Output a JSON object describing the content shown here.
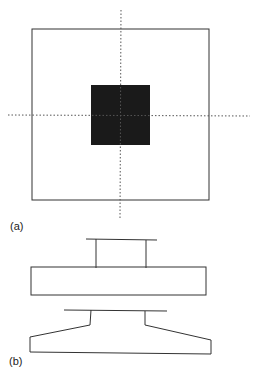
{
  "figure": {
    "panel_a": {
      "label": "(a)",
      "description": "Plan view: square outline with centered filled dark square and dotted center lines"
    },
    "panel_b": {
      "label": "(b)",
      "description": "Elevation views: block with raised top flange, and tapered base with stem"
    }
  },
  "colors": {
    "line": "#333333",
    "fill": "#1a1a1a",
    "background": "#ffffff"
  }
}
